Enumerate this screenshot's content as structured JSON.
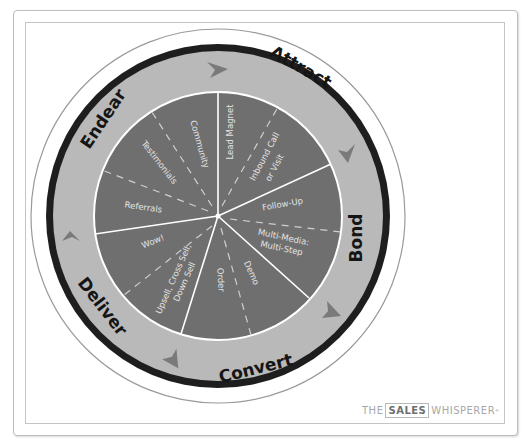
{
  "diagram": {
    "stages": [
      {
        "label": "Attract"
      },
      {
        "label": "Bond"
      },
      {
        "label": "Convert"
      },
      {
        "label": "Deliver"
      },
      {
        "label": "Endear"
      }
    ],
    "segments": [
      {
        "stage": "Attract",
        "label": "Lead Magnet"
      },
      {
        "stage": "Attract",
        "label": "Inbound Call"
      },
      {
        "stage": "Attract",
        "label": "or Visit"
      },
      {
        "stage": "Bond",
        "label": "Follow-Up"
      },
      {
        "stage": "Bond",
        "label": "Multi-Media:"
      },
      {
        "stage": "Bond",
        "label": "Multi-Step"
      },
      {
        "stage": "Convert",
        "label": "Demo"
      },
      {
        "stage": "Convert",
        "label": "Order"
      },
      {
        "stage": "Deliver",
        "label": "Upsell, Cross Sell,"
      },
      {
        "stage": "Deliver",
        "label": "Down Sell"
      },
      {
        "stage": "Deliver",
        "label": "Wow!"
      },
      {
        "stage": "Endear",
        "label": "Referrals"
      },
      {
        "stage": "Endear",
        "label": "Testimonials"
      },
      {
        "stage": "Endear",
        "label": "Community"
      }
    ],
    "colors": {
      "inner_disc": "#6f6f6f",
      "band": "#b9b9b9",
      "dark_ring": "#1e1e1e",
      "arrow": "#7a7a7a",
      "divider": "#ffffff"
    }
  },
  "logo": {
    "prefix": "THE",
    "boxed": "SALES",
    "suffix": "WHISPERER",
    "mark": "®"
  }
}
